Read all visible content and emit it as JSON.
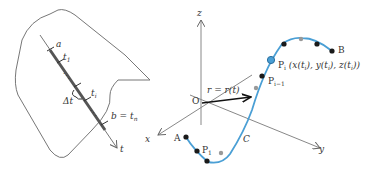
{
  "diagram": {
    "parameter_panel": {
      "labels": {
        "a": "a",
        "t1": "t",
        "t1_sub": "1",
        "ti": "t",
        "ti_sub": "i",
        "delta_t": "Δt",
        "b": "b = t",
        "b_sub": "n",
        "t_axis": "t"
      }
    },
    "axes": {
      "x": "x",
      "y": "y",
      "z": "z",
      "origin": "O"
    },
    "vector_label": "r = r(t)",
    "curve": {
      "name": "C",
      "start": "A",
      "end": "B",
      "color": "#4a9fd5",
      "points": {
        "p1": "P",
        "p1_sub": "1",
        "pim1": "P",
        "pim1_sub": "i−1",
        "pi": "P",
        "pi_sub": "i",
        "pi_coords": "(x(t",
        "pi_full": "(x(t_i), y(t_i), z(t_i))"
      }
    },
    "colors": {
      "curve": "#4a9fd5",
      "axis": "#777777",
      "point": "#1a1a1a",
      "point_gray": "#999999",
      "highlight_point": "#4a9fd5"
    }
  }
}
